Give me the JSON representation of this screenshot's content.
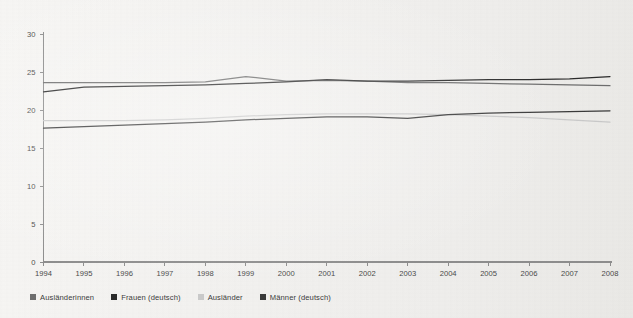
{
  "chart_data": {
    "type": "line",
    "title": "",
    "xlabel": "",
    "ylabel": "",
    "x": [
      1994,
      1995,
      1996,
      1997,
      1998,
      1999,
      2000,
      2001,
      2002,
      2003,
      2004,
      2005,
      2006,
      2007,
      2008
    ],
    "xtick_labels": [
      "1994",
      "1995",
      "1996",
      "1997",
      "1998",
      "1999",
      "2000",
      "2001",
      "2002",
      "2003",
      "2004",
      "2005",
      "2006",
      "2007",
      "2008"
    ],
    "ytick_labels": [
      "0",
      "5",
      "10",
      "15",
      "20",
      "25",
      "30"
    ],
    "yticks": [
      0,
      5,
      10,
      15,
      20,
      25,
      30
    ],
    "ylim": [
      0,
      30
    ],
    "xlim": [
      1994,
      2008
    ],
    "grid": false,
    "legend_position": "below",
    "series": [
      {
        "name": "Ausländerinnen",
        "color": "#6e6e6e",
        "values": [
          23.6,
          23.6,
          23.6,
          23.6,
          23.7,
          24.4,
          23.8,
          23.9,
          23.8,
          23.6,
          23.6,
          23.5,
          23.4,
          23.3,
          23.2
        ]
      },
      {
        "name": "Frauen (deutsch)",
        "color": "#2b2b2b",
        "values": [
          22.4,
          23.0,
          23.1,
          23.2,
          23.3,
          23.5,
          23.7,
          24.0,
          23.8,
          23.8,
          23.9,
          24.0,
          24.0,
          24.1,
          24.4
        ]
      },
      {
        "name": "Ausländer",
        "color": "#c9c9c9",
        "values": [
          18.6,
          18.6,
          18.6,
          18.7,
          18.9,
          19.2,
          19.4,
          19.5,
          19.5,
          19.5,
          19.4,
          19.2,
          19.0,
          18.7,
          18.4
        ]
      },
      {
        "name": "Männer (deutsch)",
        "color": "#3a3a3a",
        "values": [
          17.6,
          17.8,
          18.0,
          18.2,
          18.4,
          18.7,
          18.9,
          19.1,
          19.1,
          18.9,
          19.4,
          19.6,
          19.7,
          19.8,
          19.9
        ]
      }
    ]
  },
  "legend": {
    "items": [
      {
        "label": "Ausländerinnen",
        "color": "#6e6e6e"
      },
      {
        "label": "Frauen (deutsch)",
        "color": "#2b2b2b"
      },
      {
        "label": "Ausländer",
        "color": "#c9c9c9"
      },
      {
        "label": "Männer (deutsch)",
        "color": "#3a3a3a"
      }
    ]
  }
}
